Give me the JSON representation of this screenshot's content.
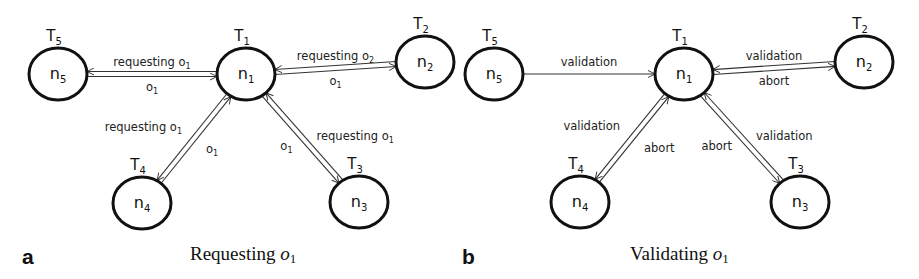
{
  "panels": [
    {
      "letter": "a",
      "caption": "Requesting",
      "caption_var": "o",
      "caption_sub": "1",
      "nodes": [
        {
          "id": "n1",
          "name": "n",
          "sub": "1",
          "task": "T",
          "task_sub": "1",
          "cx": 246,
          "cy": 74
        },
        {
          "id": "n2",
          "name": "n",
          "sub": "2",
          "task": "T",
          "task_sub": "2",
          "cx": 425,
          "cy": 62
        },
        {
          "id": "n3",
          "name": "n",
          "sub": "3",
          "task": "T",
          "task_sub": "3",
          "cx": 359,
          "cy": 202
        },
        {
          "id": "n4",
          "name": "n",
          "sub": "4",
          "task": "T",
          "task_sub": "4",
          "cx": 142,
          "cy": 203
        },
        {
          "id": "n5",
          "name": "n",
          "sub": "5",
          "task": "T",
          "task_sub": "5",
          "cx": 58,
          "cy": 74
        }
      ],
      "edges": [
        {
          "from": "n5",
          "to": "n1",
          "label": "requesting o",
          "label_sub": "1",
          "side": "top"
        },
        {
          "from": "n1",
          "to": "n5",
          "label": "o",
          "label_sub": "1",
          "side": "bottom"
        },
        {
          "from": "n2",
          "to": "n1",
          "label": "requesting o",
          "label_sub": "2",
          "side": "top"
        },
        {
          "from": "n1",
          "to": "n2",
          "label": "o",
          "label_sub": "1",
          "side": "bottom"
        },
        {
          "from": "n4",
          "to": "n1",
          "label": "requesting o",
          "label_sub": "1",
          "side": "left"
        },
        {
          "from": "n1",
          "to": "n4",
          "label": "o",
          "label_sub": "1",
          "side": "right"
        },
        {
          "from": "n3",
          "to": "n1",
          "label": "requesting o",
          "label_sub": "1",
          "side": "right"
        },
        {
          "from": "n1",
          "to": "n3",
          "label": "o",
          "label_sub": "1",
          "side": "left"
        }
      ]
    },
    {
      "letter": "b",
      "caption": "Validating",
      "caption_var": "o",
      "caption_sub": "1",
      "nodes": [
        {
          "id": "n1",
          "name": "n",
          "sub": "1",
          "task": "T",
          "task_sub": "1",
          "cx": 684,
          "cy": 74
        },
        {
          "id": "n2",
          "name": "n",
          "sub": "2",
          "task": "T",
          "task_sub": "2",
          "cx": 864,
          "cy": 62
        },
        {
          "id": "n3",
          "name": "n",
          "sub": "3",
          "task": "T",
          "task_sub": "3",
          "cx": 800,
          "cy": 202
        },
        {
          "id": "n4",
          "name": "n",
          "sub": "4",
          "task": "T",
          "task_sub": "4",
          "cx": 580,
          "cy": 202
        },
        {
          "id": "n5",
          "name": "n",
          "sub": "5",
          "task": "T",
          "task_sub": "5",
          "cx": 494,
          "cy": 74
        }
      ],
      "edges": [
        {
          "from": "n5",
          "to": "n1",
          "label": "validation",
          "label_sub": "",
          "side": "single"
        },
        {
          "from": "n2",
          "to": "n1",
          "label": "validation",
          "label_sub": "",
          "side": "top"
        },
        {
          "from": "n1",
          "to": "n2",
          "label": "abort",
          "label_sub": "",
          "side": "bottom"
        },
        {
          "from": "n4",
          "to": "n1",
          "label": "validation",
          "label_sub": "",
          "side": "left"
        },
        {
          "from": "n1",
          "to": "n4",
          "label": "abort",
          "label_sub": "",
          "side": "right"
        },
        {
          "from": "n3",
          "to": "n1",
          "label": "validation",
          "label_sub": "",
          "side": "right"
        },
        {
          "from": "n1",
          "to": "n3",
          "label": "abort",
          "label_sub": "",
          "side": "left"
        }
      ]
    }
  ],
  "style": {
    "stroke": "#111111",
    "edge": "#333333",
    "background": "#ffffff"
  }
}
